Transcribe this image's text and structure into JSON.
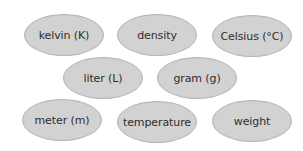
{
  "diagram": {
    "type": "word-bank",
    "colors": {
      "background": "#ffffff",
      "ellipse_fill": "#d2d2d2",
      "ellipse_border": "#b4b4b4",
      "text": "#2e2e2e"
    },
    "terms": [
      {
        "label": "kelvin (K)",
        "row": 1,
        "col": 1
      },
      {
        "label": "density",
        "row": 1,
        "col": 2
      },
      {
        "label": "Celsius (°C)",
        "row": 1,
        "col": 3
      },
      {
        "label": "liter (L)",
        "row": 2,
        "col": 1
      },
      {
        "label": "gram (g)",
        "row": 2,
        "col": 2
      },
      {
        "label": "meter (m)",
        "row": 3,
        "col": 1
      },
      {
        "label": "temperature",
        "row": 3,
        "col": 2
      },
      {
        "label": "weight",
        "row": 3,
        "col": 3
      }
    ]
  }
}
